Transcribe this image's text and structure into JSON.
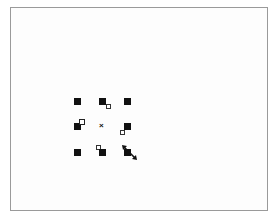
{
  "canvas": {
    "border_color": "#9a9a9a",
    "background": "#fdfdfd"
  },
  "selection": {
    "handle_color": "#111111",
    "handles": [
      {
        "name": "top-left",
        "x": 74,
        "y": 98
      },
      {
        "name": "top-center",
        "x": 99,
        "y": 98
      },
      {
        "name": "top-right",
        "x": 124,
        "y": 98
      },
      {
        "name": "middle-left",
        "x": 74,
        "y": 123
      },
      {
        "name": "middle-right",
        "x": 124,
        "y": 123
      },
      {
        "name": "bottom-left",
        "x": 74,
        "y": 149
      },
      {
        "name": "bottom-center",
        "x": 99,
        "y": 149
      },
      {
        "name": "bottom-right",
        "x": 124,
        "y": 149
      }
    ],
    "center_marker": "×",
    "cursor": "resize-diagonal"
  }
}
